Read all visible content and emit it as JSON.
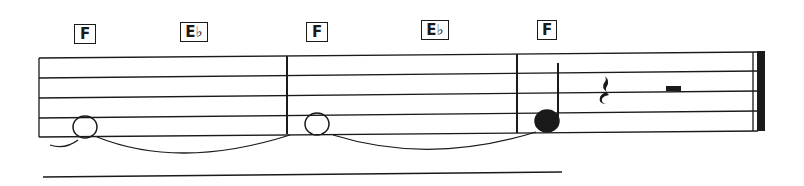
{
  "score": {
    "colors": {
      "ink": "#1a1a1a",
      "paper": "#ffffff"
    },
    "chords": [
      {
        "label": "F",
        "x": 74,
        "y": 24,
        "w": 22
      },
      {
        "label": "E♭",
        "x": 180,
        "y": 22,
        "w": 28
      },
      {
        "label": "F",
        "x": 306,
        "y": 22,
        "w": 22
      },
      {
        "label": "E♭",
        "x": 421,
        "y": 20,
        "w": 28
      },
      {
        "label": "F",
        "x": 537,
        "y": 20,
        "w": 20
      }
    ],
    "measures": [
      {
        "index": 1,
        "content": "whole note F (tied)"
      },
      {
        "index": 2,
        "content": "whole note F (tied)"
      },
      {
        "index": 3,
        "content": "quarter note F, quarter rest, half rest, final barline"
      }
    ]
  }
}
